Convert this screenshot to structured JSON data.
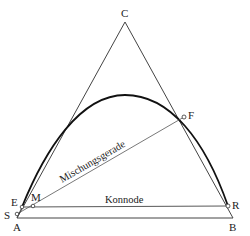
{
  "diagram": {
    "type": "ternary-phase-diagram",
    "vertices": {
      "top": {
        "label": "C"
      },
      "bottom_left": {
        "label": "A"
      },
      "bottom_right": {
        "label": "B"
      }
    },
    "points": {
      "E": {
        "label": "E"
      },
      "S": {
        "label": "S"
      },
      "M": {
        "label": "M"
      },
      "F": {
        "label": "F"
      },
      "R": {
        "label": "R"
      }
    },
    "lines": {
      "mixing_line": {
        "label": "Mischungsgerade"
      },
      "tie_line": {
        "label": "Konnode"
      }
    },
    "colors": {
      "stroke": "#333333",
      "curve": "#111111",
      "background": "#ffffff"
    }
  }
}
